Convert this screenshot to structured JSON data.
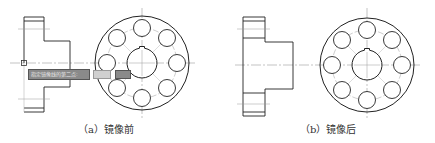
{
  "figure": {
    "panels": [
      {
        "id": "a",
        "caption": "（a）镜像前",
        "state": "before-mirror",
        "tooltip": {
          "prompt": "指定镜像线的第二点:",
          "field1": "",
          "field2": ""
        }
      },
      {
        "id": "b",
        "caption": "（b）镜像后",
        "state": "after-mirror"
      }
    ],
    "colors": {
      "line": "#222222",
      "centerline": "#9a9a9a",
      "tooltip_bg": "#8a8a8a",
      "background": "#ffffff"
    }
  }
}
